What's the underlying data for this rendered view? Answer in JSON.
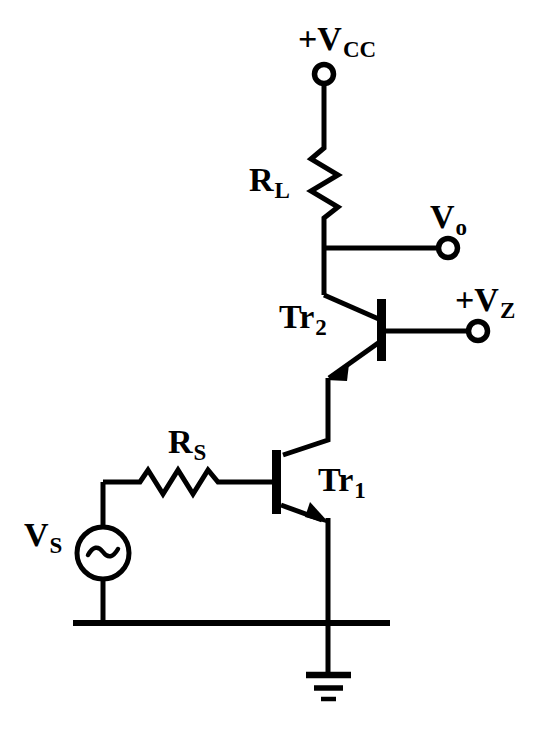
{
  "diagram": {
    "type": "circuit-schematic",
    "stroke_color": "#000000",
    "background_color": "#ffffff",
    "labels": {
      "supply": {
        "main": "+V",
        "sub": "CC"
      },
      "load_resistor": {
        "main": "R",
        "sub": "L"
      },
      "output": {
        "main": "V",
        "sub": "o"
      },
      "zener_bias": {
        "main": "+V",
        "sub": "Z"
      },
      "transistor_2": {
        "main": "Tr",
        "sub": "2"
      },
      "source_resistor": {
        "main": "R",
        "sub": "S"
      },
      "transistor_1": {
        "main": "Tr",
        "sub": "1"
      },
      "source_voltage": {
        "main": "V",
        "sub": "S"
      }
    },
    "components": [
      {
        "name": "supply-terminal",
        "kind": "terminal-node",
        "label": "+V_CC",
        "x": 324,
        "y": 74
      },
      {
        "name": "load-resistor",
        "kind": "resistor",
        "label": "R_L",
        "orientation": "vertical"
      },
      {
        "name": "output-terminal",
        "kind": "terminal-node",
        "label": "V_o",
        "x": 448,
        "y": 248
      },
      {
        "name": "transistor-tr2",
        "kind": "npn-transistor",
        "label": "Tr_2"
      },
      {
        "name": "zener-bias-terminal",
        "kind": "terminal-node",
        "label": "+V_Z",
        "x": 478,
        "y": 332
      },
      {
        "name": "transistor-tr1",
        "kind": "npn-transistor",
        "label": "Tr_1"
      },
      {
        "name": "source-resistor",
        "kind": "resistor",
        "label": "R_S",
        "orientation": "horizontal"
      },
      {
        "name": "ac-source",
        "kind": "ac-voltage-source",
        "label": "V_S",
        "x": 103,
        "y": 553
      },
      {
        "name": "ground-symbol",
        "kind": "ground",
        "label": "",
        "x": 328,
        "y": 623
      }
    ]
  }
}
